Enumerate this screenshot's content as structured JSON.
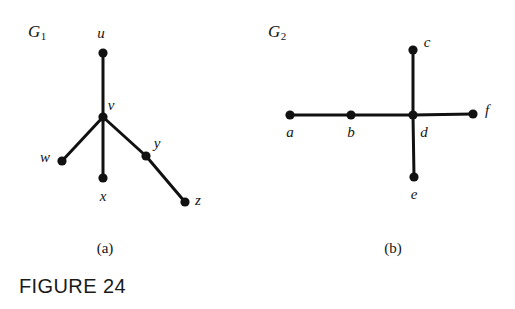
{
  "figure": {
    "caption": "FIGURE 24",
    "background_color": "#ffffff",
    "stroke_color": "#111111"
  },
  "panels": [
    {
      "id": "panel-a",
      "label": "(a)",
      "label_pos": {
        "x": 105,
        "y": 248
      },
      "graph_title": "G",
      "graph_title_subscript": "1",
      "graph_title_pos": {
        "x": 28,
        "y": 22
      },
      "nodes": [
        {
          "id": "u",
          "label": "u",
          "x": 103,
          "y": 53,
          "label_x": 101,
          "label_y": 33
        },
        {
          "id": "v",
          "label": "v",
          "x": 103,
          "y": 117,
          "label_x": 111,
          "label_y": 105
        },
        {
          "id": "w",
          "label": "w",
          "x": 62,
          "y": 161,
          "label_x": 45,
          "label_y": 157
        },
        {
          "id": "x",
          "label": "x",
          "x": 103,
          "y": 178,
          "label_x": 103,
          "label_y": 196
        },
        {
          "id": "y",
          "label": "y",
          "x": 146,
          "y": 156,
          "label_x": 157,
          "label_y": 143
        },
        {
          "id": "z",
          "label": "z",
          "x": 185,
          "y": 202,
          "label_x": 198,
          "label_y": 200
        }
      ],
      "edges": [
        {
          "from": "u",
          "to": "v"
        },
        {
          "from": "v",
          "to": "w"
        },
        {
          "from": "v",
          "to": "x"
        },
        {
          "from": "v",
          "to": "y"
        },
        {
          "from": "y",
          "to": "z"
        }
      ]
    },
    {
      "id": "panel-b",
      "label": "(b)",
      "label_pos": {
        "x": 393,
        "y": 248
      },
      "graph_title": "G",
      "graph_title_subscript": "2",
      "graph_title_pos": {
        "x": 268,
        "y": 22
      },
      "nodes": [
        {
          "id": "a",
          "label": "a",
          "x": 290,
          "y": 115,
          "label_x": 290,
          "label_y": 132
        },
        {
          "id": "b",
          "label": "b",
          "x": 351,
          "y": 115,
          "label_x": 351,
          "label_y": 132
        },
        {
          "id": "c",
          "label": "c",
          "x": 413,
          "y": 50,
          "label_x": 427,
          "label_y": 42
        },
        {
          "id": "d",
          "label": "d",
          "x": 413,
          "y": 115,
          "label_x": 424,
          "label_y": 132
        },
        {
          "id": "e",
          "label": "e",
          "x": 414,
          "y": 177,
          "label_x": 414,
          "label_y": 194
        },
        {
          "id": "f",
          "label": "f",
          "x": 473,
          "y": 114,
          "label_x": 487,
          "label_y": 110
        }
      ],
      "edges": [
        {
          "from": "a",
          "to": "b"
        },
        {
          "from": "b",
          "to": "d"
        },
        {
          "from": "d",
          "to": "c"
        },
        {
          "from": "d",
          "to": "e"
        },
        {
          "from": "d",
          "to": "f"
        }
      ]
    }
  ],
  "style": {
    "edge_width": 3,
    "node_radius": 4.6
  }
}
